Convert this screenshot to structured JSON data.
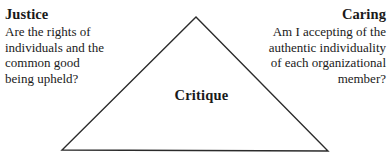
{
  "canvas": {
    "width": 390,
    "height": 162,
    "background": "#ffffff",
    "text_color": "#1a1a1a"
  },
  "diagram": {
    "type": "triangle-framework",
    "shape": {
      "name": "triangle",
      "stroke": "#2b2b2b",
      "stroke_width": 1.4,
      "fill": "none",
      "apex": {
        "x": 196,
        "y": 17
      },
      "bottom_left": {
        "x": 62,
        "y": 150
      },
      "bottom_right": {
        "x": 328,
        "y": 151
      }
    },
    "center_label": "Critique",
    "corners": [
      {
        "id": "justice",
        "heading": "Justice",
        "align": "left",
        "body_lines": [
          "Are the rights of",
          "individuals and the",
          "common good",
          "being upheld?"
        ]
      },
      {
        "id": "caring",
        "heading": "Caring",
        "align": "right",
        "body_lines": [
          "Am I accepting of the",
          "authentic individuality",
          "of each organizational",
          "member?"
        ]
      }
    ],
    "footer_clipped_text": "Wh"
  }
}
